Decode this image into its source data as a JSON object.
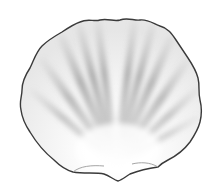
{
  "image": {
    "subject": "scallop shell",
    "style": "grayscale pencil/halftone illustration",
    "background": "#ffffff",
    "colors": {
      "outline": "#3a3a3a",
      "rib_dark": "#8a8a8a",
      "rib_mid": "#b5b5b5",
      "highlight": "#ffffff"
    },
    "rib_count": 12
  }
}
